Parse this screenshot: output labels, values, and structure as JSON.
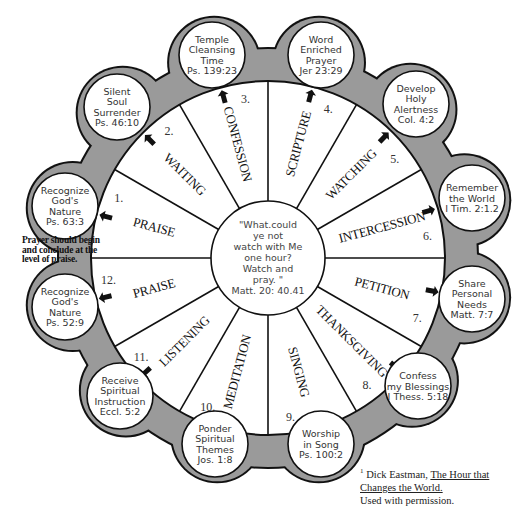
{
  "diagram": {
    "center": {
      "quote_lines": [
        "\"What.could",
        "ye not",
        "watch with Me",
        "one hour?",
        "Watch and",
        "pray. \""
      ],
      "reference": "Matt. 20: 40.41"
    },
    "segments": [
      {
        "number": "1.",
        "label": "PRAISE",
        "bubble": [
          "Recognize",
          "God's",
          "Nature",
          "Ps. 63:3"
        ]
      },
      {
        "number": "2.",
        "label": "WAITING",
        "bubble": [
          "Silent",
          "Soul",
          "Surrender",
          "Ps. 46:10"
        ]
      },
      {
        "number": "3.",
        "label": "CONFESSION",
        "bubble": [
          "Temple",
          "Cleansing",
          "Time",
          "Ps. 139:23"
        ]
      },
      {
        "number": "4.",
        "label": "SCRIPTURE",
        "bubble": [
          "Word",
          "Enriched",
          "Prayer",
          "Jer 23:29"
        ]
      },
      {
        "number": "5.",
        "label": "WATCHING",
        "bubble": [
          "Develop",
          "Holy",
          "Alertness",
          "Col. 4:2"
        ]
      },
      {
        "number": "6.",
        "label": "INTERCESSION",
        "bubble": [
          "Remember",
          "the World",
          "I Tim. 2:1.2"
        ]
      },
      {
        "number": "7.",
        "label": "PETITION",
        "bubble": [
          "Share",
          "Personal",
          "Needs",
          "Matt. 7:7"
        ]
      },
      {
        "number": "8.",
        "label": "THANKSGIVING",
        "bubble": [
          "Confess",
          "my Blessings",
          "I Thess. 5:18"
        ]
      },
      {
        "number": "9.",
        "label": "SINGING",
        "bubble": [
          "Worship",
          "in Song",
          "Ps. 100:2"
        ]
      },
      {
        "number": "10.",
        "label": "MEDITATION",
        "bubble": [
          "Ponder",
          "Spiritual",
          "Themes",
          "Jos. 1:8"
        ]
      },
      {
        "number": "11.",
        "label": "LISTENING",
        "bubble": [
          "Receive",
          "Spiritual",
          "Instruction",
          "Eccl. 5:2"
        ]
      },
      {
        "number": "12.",
        "label": "PRAISE",
        "bubble": [
          "Recognize",
          "God's",
          "Nature",
          "Ps. 52:9"
        ]
      }
    ],
    "side_note": "Prayer should begin and conclude at the level of praise.",
    "footnote": {
      "marker": "1",
      "author": "Dick Eastman,",
      "book_title": "The Hour that Changes the World.",
      "permission": "Used with permission."
    },
    "colors": {
      "band": "#9a9a9a",
      "stroke": "#111111",
      "fill": "#ffffff"
    }
  }
}
